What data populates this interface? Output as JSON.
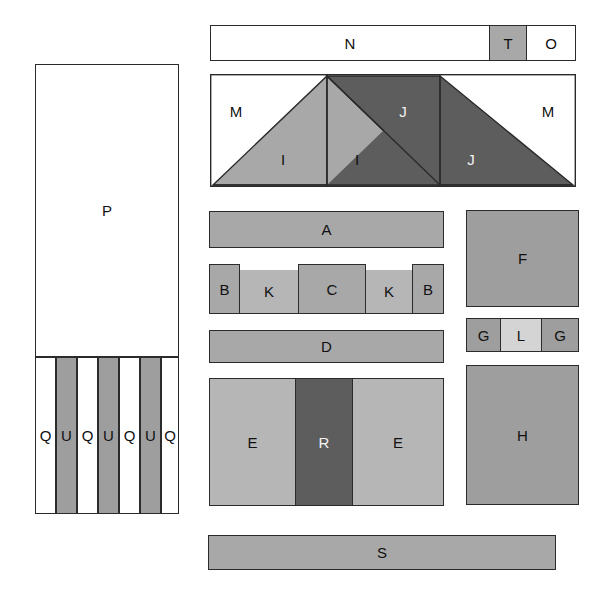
{
  "diagram": {
    "background": "#ffffff",
    "stroke": "#2b2b2b",
    "palette": {
      "white": "#ffffff",
      "light": "#d4d4d4",
      "medium": "#a8a8a8",
      "dark": "#5d5d5d",
      "strip_gray": "#9e9e9e"
    }
  },
  "left_panel": {
    "name": "left-column",
    "top_block": {
      "label": "P",
      "fill": "#ffffff"
    },
    "strips": [
      {
        "label": "Q",
        "fill": "#ffffff"
      },
      {
        "label": "U",
        "fill": "#9e9e9e"
      },
      {
        "label": "Q",
        "fill": "#ffffff"
      },
      {
        "label": "U",
        "fill": "#9e9e9e"
      },
      {
        "label": "Q",
        "fill": "#ffffff"
      },
      {
        "label": "U",
        "fill": "#9e9e9e"
      },
      {
        "label": "Q",
        "fill": "#ffffff"
      }
    ]
  },
  "top_bar": {
    "name": "header-bar",
    "segments": [
      {
        "label": "N",
        "fill": "#ffffff"
      },
      {
        "label": "T",
        "fill": "#a8a8a8"
      },
      {
        "label": "O",
        "fill": "#ffffff"
      }
    ]
  },
  "triangle_panel": {
    "name": "gable-panel",
    "corner_left": {
      "label": "M",
      "fill": "#ffffff"
    },
    "corner_right": {
      "label": "M",
      "fill": "#ffffff"
    },
    "slopes": [
      {
        "label": "I",
        "fill": "#a8a8a8"
      },
      {
        "label": "I",
        "fill": "#a8a8a8"
      },
      {
        "label": "J",
        "fill": "#5d5d5d"
      },
      {
        "label": "J",
        "fill": "#5d5d5d"
      }
    ]
  },
  "center_rows": {
    "row_a": [
      {
        "label": "A",
        "fill": "#a8a8a8"
      }
    ],
    "row_bkckb": [
      {
        "label": "B",
        "fill": "#a8a8a8"
      },
      {
        "label": "K",
        "fill": "#b6b6b6"
      },
      {
        "label": "C",
        "fill": "#a8a8a8"
      },
      {
        "label": "K",
        "fill": "#b6b6b6"
      },
      {
        "label": "B",
        "fill": "#a8a8a8"
      }
    ],
    "row_d": [
      {
        "label": "D",
        "fill": "#a8a8a8"
      }
    ],
    "row_ere": [
      {
        "label": "E",
        "fill": "#b6b6b6"
      },
      {
        "label": "R",
        "fill": "#5d5d5d"
      },
      {
        "label": "E",
        "fill": "#b6b6b6"
      }
    ]
  },
  "right_column": {
    "box_f": {
      "label": "F",
      "fill": "#9e9e9e"
    },
    "row_glg": [
      {
        "label": "G",
        "fill": "#9e9e9e"
      },
      {
        "label": "L",
        "fill": "#d4d4d4"
      },
      {
        "label": "G",
        "fill": "#9e9e9e"
      }
    ],
    "box_h": {
      "label": "H",
      "fill": "#9e9e9e"
    }
  },
  "footer_bar": {
    "label": "S",
    "fill": "#a8a8a8"
  }
}
